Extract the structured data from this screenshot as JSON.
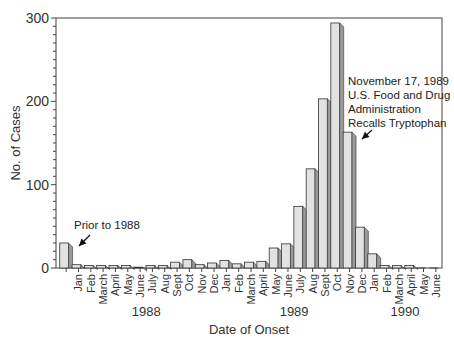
{
  "chart_data": {
    "type": "bar",
    "title": "",
    "xlabel": "Date of Onset",
    "ylabel": "No. of Cases",
    "ylim": [
      0,
      300
    ],
    "yticks": [
      0,
      100,
      200,
      300
    ],
    "grid": false,
    "categories": [
      "Prior to 1988",
      "Jan",
      "Feb",
      "March",
      "April",
      "May",
      "June",
      "July",
      "Aug",
      "Sept",
      "Oct",
      "Nov",
      "Dec",
      "Jan",
      "Feb",
      "March",
      "April",
      "May",
      "June",
      "July",
      "Aug",
      "Sept",
      "Oct",
      "Nov",
      "Dec",
      "Jan",
      "Feb",
      "March",
      "April",
      "May",
      "June"
    ],
    "years": [
      {
        "label": "1988",
        "start": 1,
        "end": 12
      },
      {
        "label": "1989",
        "start": 13,
        "end": 24
      },
      {
        "label": "1990",
        "start": 25,
        "end": 30
      }
    ],
    "values": [
      30,
      4,
      3,
      3,
      3,
      3,
      1,
      3,
      3,
      7,
      10,
      4,
      6,
      9,
      5,
      7,
      8,
      24,
      29,
      74,
      119,
      203,
      294,
      163,
      49,
      17,
      3,
      3,
      3,
      0,
      0
    ],
    "annotations": [
      {
        "text": "Prior to 1988",
        "target": 0
      },
      {
        "text": "November 17, 1989\nU.S. Food and Drug\nAdministration\nRecalls Tryptophan",
        "target": 23
      }
    ]
  },
  "annotations": {
    "prior": "Prior to 1988",
    "recall_line1": "November 17, 1989",
    "recall_line2": "U.S. Food and Drug",
    "recall_line3": "Administration",
    "recall_line4": "Recalls Tryptophan"
  }
}
